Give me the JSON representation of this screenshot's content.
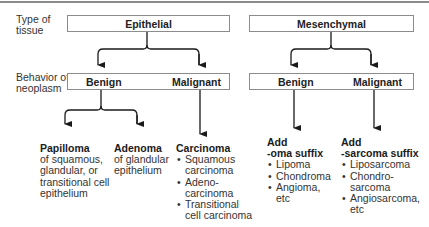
{
  "row_labels": {
    "type_of_tissue": [
      "Type of",
      "tissue"
    ],
    "behavior": [
      "Behavior of",
      "neoplasm"
    ]
  },
  "epithelial": {
    "title": "Epithelial",
    "benign": "Benign",
    "malignant": "Malignant",
    "papilloma": {
      "heading": "Papilloma",
      "lines": [
        "of squamous,",
        "glandular, or",
        "transitional cell",
        "epithelium"
      ]
    },
    "adenoma": {
      "heading": "Adenoma",
      "lines": [
        "of glandular",
        "epithelium"
      ]
    },
    "carcinoma": {
      "heading": "Carcinoma",
      "items": [
        [
          "Squamous",
          "carcinoma"
        ],
        [
          "Adeno-",
          "carcinoma"
        ],
        [
          "Transitional",
          "cell carcinoma"
        ]
      ]
    }
  },
  "mesenchymal": {
    "title": "Mesenchymal",
    "benign": "Benign",
    "malignant": "Malignant",
    "benign_result": {
      "heading": [
        "Add",
        "-oma suffix"
      ],
      "items": [
        [
          "Lipoma"
        ],
        [
          "Chondroma"
        ],
        [
          "Angioma,",
          "etc"
        ]
      ]
    },
    "malignant_result": {
      "heading": [
        "Add",
        "-sarcoma suffix"
      ],
      "items": [
        [
          "Liposarcoma"
        ],
        [
          "Chondro-",
          "sarcoma"
        ],
        [
          "Angiosarcoma,",
          "etc"
        ]
      ]
    }
  },
  "colors": {
    "line": "#1a1a1a",
    "box_border": "#8c8c8c",
    "top_rule": "#8a8a8a"
  }
}
